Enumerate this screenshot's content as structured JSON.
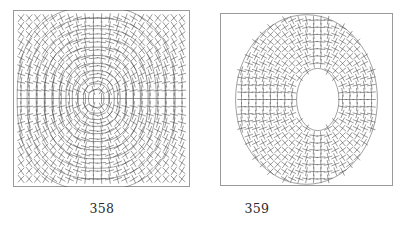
{
  "document": {
    "kind": "figure-plate",
    "background_color": "#ffffff",
    "ink_color": "#3a3a3a",
    "frame_color": "#9a9a9a",
    "caption_color": "#2a2a2a"
  },
  "panels": [
    {
      "id": "358",
      "caption": "358",
      "frame": {
        "x": 13,
        "y": 10,
        "width": 177,
        "height": 177,
        "stroke": "#9a9a9a"
      },
      "icon_name": "square-frame-icon",
      "content_type": "contour-plot-with-line-field",
      "description": "Square domain containing nested closed oval level curves centred slightly left of middle, overlaid by a regular grid of short line-segment ticks (line element / direction field) that cross to form plus and ex marks.",
      "chart_data": {
        "type": "contour",
        "title": "",
        "xlabel": "",
        "ylabel": "",
        "xlim": [
          -1,
          1
        ],
        "ylim": [
          -1,
          1
        ],
        "grid": false,
        "field": {
          "type": "line-field",
          "nx": 21,
          "ny": 21,
          "tick_length": 4.6,
          "center_x": -0.06,
          "center_y": 0.0,
          "aspect": 0.86
        },
        "contours": {
          "center_x": -0.06,
          "center_y": 0.0,
          "aspect": 0.86,
          "levels": [
            0.085,
            0.14,
            0.2,
            0.265,
            0.335,
            0.41,
            0.49,
            0.575,
            0.665,
            0.765,
            0.875
          ],
          "closed": true,
          "superellipse_exponent": 2.45
        }
      }
    },
    {
      "id": "359",
      "caption": "359",
      "frame": {
        "x": 220,
        "y": 13,
        "width": 173,
        "height": 173,
        "stroke": "#9a9a9a"
      },
      "icon_name": "square-frame-icon",
      "content_type": "annulus-crosshatch-field",
      "description": "Square frame containing an annular region between a large outer oval and a small off-centre inner oval hole; the ring is filled with a dense regular array of short crossing line segments forming plus and ex marks.",
      "chart_data": {
        "type": "contour",
        "title": "",
        "xlabel": "",
        "ylabel": "",
        "xlim": [
          -1,
          1
        ],
        "ylim": [
          -1,
          1
        ],
        "grid": false,
        "region": {
          "outer_ellipse": {
            "cx": 0.0,
            "cy": 0.0,
            "rx": 0.82,
            "ry": 0.98
          },
          "inner_ellipse": {
            "cx": 0.13,
            "cy": 0.0,
            "rx": 0.245,
            "ry": 0.36
          }
        },
        "field": {
          "type": "line-field",
          "nx": 23,
          "ny": 23,
          "tick_length": 4.4
        }
      }
    }
  ]
}
